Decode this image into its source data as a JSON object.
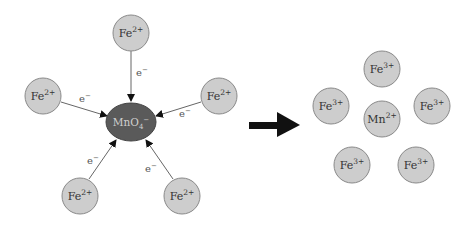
{
  "reactants": {
    "oxidant": {
      "label": "MnO",
      "subscript": "4",
      "charge": "−",
      "color": "#5a5a5a"
    },
    "ions": [
      {
        "label": "Fe",
        "charge": "2+",
        "electron": "e",
        "electron_charge": "−"
      },
      {
        "label": "Fe",
        "charge": "2+",
        "electron": "e",
        "electron_charge": "−"
      },
      {
        "label": "Fe",
        "charge": "2+",
        "electron": "e",
        "electron_charge": "−"
      },
      {
        "label": "Fe",
        "charge": "2+",
        "electron": "e",
        "electron_charge": "−"
      },
      {
        "label": "Fe",
        "charge": "2+",
        "electron": "e",
        "electron_charge": "−"
      }
    ]
  },
  "reaction_arrow": {
    "icon": "right-arrow-icon",
    "color": "#111111"
  },
  "products": {
    "center": {
      "label": "Mn",
      "charge": "2+"
    },
    "ions": [
      {
        "label": "Fe",
        "charge": "3+"
      },
      {
        "label": "Fe",
        "charge": "3+"
      },
      {
        "label": "Fe",
        "charge": "3+"
      },
      {
        "label": "Fe",
        "charge": "3+"
      },
      {
        "label": "Fe",
        "charge": "3+"
      }
    ]
  },
  "colors": {
    "ion_fill": "#cdcdcd",
    "ion_stroke": "#8a8a8a",
    "line": "#666666"
  }
}
